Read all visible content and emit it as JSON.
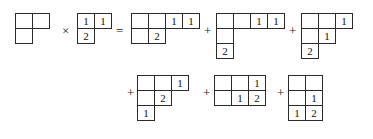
{
  "figure": {
    "kind": "young-tableaux-product-expansion",
    "background": "#ffffff",
    "ink": "#2b2b2b",
    "operators": {
      "times": "×",
      "equals": "=",
      "plus": "+"
    },
    "rows": [
      {
        "id": "line-1",
        "items": [
          {
            "type": "tableau",
            "name": "left-factor-shape",
            "x": 16,
            "y": 14,
            "rows": [
              [
                "",
                ""
              ],
              [
                ""
              ]
            ]
          },
          {
            "type": "operator",
            "name": "times-operator",
            "x": 62,
            "y": 24,
            "glyph": "×"
          },
          {
            "type": "tableau",
            "name": "right-factor-tableau",
            "x": 78,
            "y": 14,
            "rows": [
              [
                "1",
                "1"
              ],
              [
                "2"
              ]
            ]
          },
          {
            "type": "operator",
            "name": "equals-operator",
            "x": 116,
            "y": 24,
            "glyph": "="
          },
          {
            "type": "tableau",
            "name": "result-term-1",
            "x": 132,
            "y": 14,
            "rows": [
              [
                "",
                "",
                "1",
                "1"
              ],
              [
                "",
                "2"
              ]
            ]
          },
          {
            "type": "operator",
            "name": "plus-operator-1",
            "x": 204,
            "y": 24,
            "glyph": "+"
          },
          {
            "type": "tableau",
            "name": "result-term-2",
            "x": 217,
            "y": 14,
            "rows": [
              [
                "",
                "",
                "1",
                "1"
              ],
              [
                ""
              ],
              [
                "2"
              ]
            ]
          },
          {
            "type": "operator",
            "name": "plus-operator-2",
            "x": 289,
            "y": 24,
            "glyph": "+"
          },
          {
            "type": "tableau",
            "name": "result-term-3",
            "x": 302,
            "y": 14,
            "rows": [
              [
                "",
                "",
                "1"
              ],
              [
                "",
                "1"
              ],
              [
                "2"
              ]
            ]
          }
        ]
      },
      {
        "id": "line-2",
        "items": [
          {
            "type": "operator",
            "name": "plus-operator-3",
            "x": 127,
            "y": 86,
            "glyph": "+"
          },
          {
            "type": "tableau",
            "name": "result-term-4",
            "x": 138,
            "y": 76,
            "rows": [
              [
                "",
                "",
                "1"
              ],
              [
                "",
                "2"
              ],
              [
                "1"
              ]
            ]
          },
          {
            "type": "operator",
            "name": "plus-operator-4",
            "x": 203,
            "y": 86,
            "glyph": "+"
          },
          {
            "type": "tableau",
            "name": "result-term-5",
            "x": 215,
            "y": 76,
            "rows": [
              [
                "",
                "",
                "1"
              ],
              [
                "",
                "1",
                "2"
              ]
            ]
          },
          {
            "type": "operator",
            "name": "plus-operator-5",
            "x": 277,
            "y": 86,
            "glyph": "+"
          },
          {
            "type": "tableau",
            "name": "result-term-6",
            "x": 289,
            "y": 76,
            "rows": [
              [
                "",
                ""
              ],
              [
                "",
                "1"
              ],
              [
                "1",
                "2"
              ]
            ]
          }
        ]
      }
    ]
  }
}
